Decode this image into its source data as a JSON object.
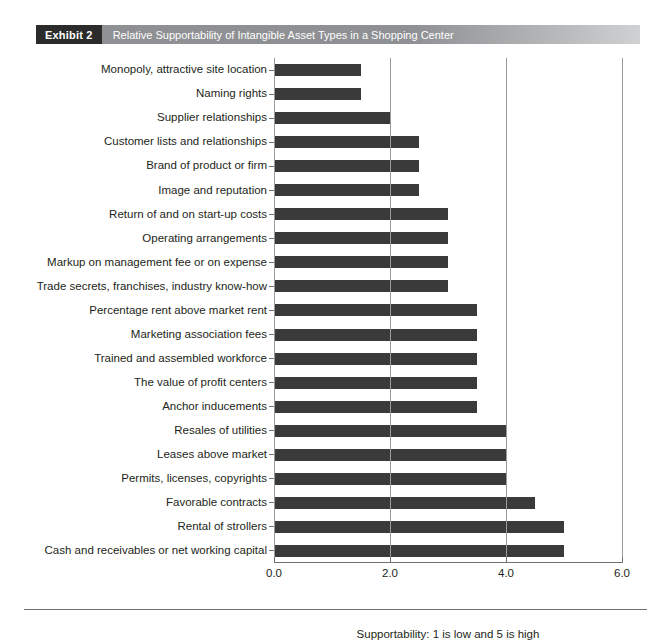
{
  "exhibit": {
    "tag": "Exhibit 2",
    "title": "Relative Supportability of Intangible Asset Types in a Shopping Center"
  },
  "chart_data": {
    "type": "bar",
    "orientation": "horizontal",
    "title": "Relative Supportability of Intangible Asset Types in a Shopping Center",
    "xlabel": "Supportability: 1 is low and 5 is high",
    "ylabel": "",
    "xlim": [
      0.0,
      6.0
    ],
    "xticks": [
      "0.0",
      "2.0",
      "4.0",
      "6.0"
    ],
    "xtick_values": [
      0.0,
      2.0,
      4.0,
      6.0
    ],
    "grid": "vertical",
    "legend": "none",
    "bar_color": "#3a3a3a",
    "categories": [
      "Monopoly, attractive site location",
      "Naming rights",
      "Supplier relationships",
      "Customer lists and relationships",
      "Brand of product or firm",
      "Image and reputation",
      "Return of and on start-up costs",
      "Operating arrangements",
      "Markup on management fee or on expense",
      "Trade secrets, franchises, industry know-how",
      "Percentage rent above market rent",
      "Marketing association fees",
      "Trained and assembled workforce",
      "The value of profit centers",
      "Anchor inducements",
      "Resales of utilities",
      "Leases above market",
      "Permits, licenses, copyrights",
      "Favorable contracts",
      "Rental of strollers",
      "Cash and receivables or net working capital"
    ],
    "values": [
      1.5,
      1.5,
      2.0,
      2.5,
      2.5,
      2.5,
      3.0,
      3.0,
      3.0,
      3.0,
      3.5,
      3.5,
      3.5,
      3.5,
      3.5,
      4.0,
      4.0,
      4.0,
      4.5,
      5.0,
      5.0
    ]
  }
}
